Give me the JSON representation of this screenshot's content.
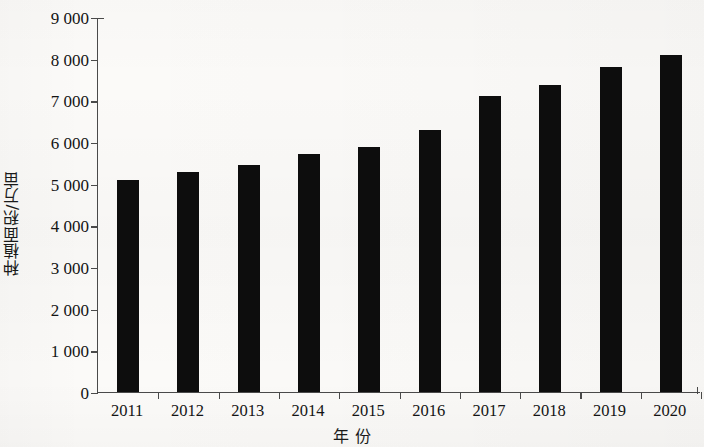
{
  "chart_data": {
    "type": "bar",
    "title": "",
    "subtitle": "",
    "xlabel": "年  份",
    "ylabel": "种植面积/万亩",
    "categories": [
      "2011",
      "2012",
      "2013",
      "2014",
      "2015",
      "2016",
      "2017",
      "2018",
      "2019",
      "2020"
    ],
    "values": [
      5090,
      5280,
      5440,
      5710,
      5870,
      6290,
      7110,
      7380,
      7790,
      8080
    ],
    "series": [
      {
        "name": "种植面积",
        "values": [
          5090,
          5280,
          5440,
          5710,
          5870,
          6290,
          7110,
          7380,
          7790,
          8080
        ]
      }
    ],
    "ylim": [
      0,
      9000
    ],
    "y_ticks": [
      0,
      1000,
      2000,
      3000,
      4000,
      5000,
      6000,
      7000,
      8000,
      9000
    ],
    "y_tick_labels": [
      "0",
      "1 000",
      "2 000",
      "3 000",
      "4 000",
      "5 000",
      "6 000",
      "7 000",
      "8 000",
      "9 000"
    ],
    "grid": false,
    "legend": null,
    "legend_position": "none",
    "bar_color": "#0d0d0d",
    "axis_color": "#4a4a4a",
    "background_color": "#fbfaf8"
  }
}
